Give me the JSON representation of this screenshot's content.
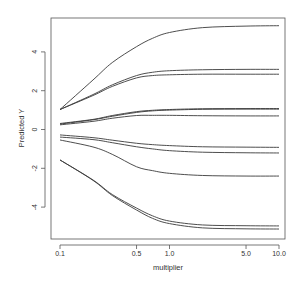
{
  "chart_data": {
    "type": "line",
    "title": "",
    "xlabel": "multiplier",
    "ylabel": "Predicted Y",
    "x_scale": "log",
    "xlim": [
      0.1,
      10.0
    ],
    "ylim": [
      -5.6,
      5.6
    ],
    "grid": false,
    "legend": null,
    "x_ticks": [
      {
        "value": 0.1,
        "label": "0.1"
      },
      {
        "value": 0.5,
        "label": "0.5"
      },
      {
        "value": 1.0,
        "label": "1.0"
      },
      {
        "value": 5.0,
        "label": "5.0"
      },
      {
        "value": 10.0,
        "label": "10.0"
      }
    ],
    "y_ticks": [
      {
        "value": 4,
        "label": "4"
      },
      {
        "value": 2,
        "label": "2"
      },
      {
        "value": 0,
        "label": "0"
      },
      {
        "value": -2,
        "label": "-2"
      },
      {
        "value": -4,
        "label": "-4"
      }
    ],
    "x": [
      0.1,
      0.2,
      0.3,
      0.5,
      0.7,
      1.0,
      2.0,
      5.0,
      10.0
    ],
    "series": [
      {
        "name": "line-1",
        "values": [
          1.03,
          2.55,
          3.45,
          4.27,
          4.7,
          5.0,
          5.25,
          5.33,
          5.35
        ]
      },
      {
        "name": "line-2",
        "values": [
          1.03,
          1.8,
          2.3,
          2.78,
          2.95,
          3.03,
          3.08,
          3.1,
          3.1
        ]
      },
      {
        "name": "line-3",
        "values": [
          1.03,
          1.75,
          2.22,
          2.66,
          2.78,
          2.82,
          2.85,
          2.85,
          2.85
        ]
      },
      {
        "name": "line-4",
        "values": [
          0.31,
          0.52,
          0.72,
          0.92,
          0.99,
          1.03,
          1.07,
          1.08,
          1.08
        ]
      },
      {
        "name": "line-5",
        "values": [
          0.28,
          0.5,
          0.68,
          0.88,
          0.96,
          1.0,
          1.04,
          1.05,
          1.05
        ]
      },
      {
        "name": "line-6",
        "values": [
          0.24,
          0.42,
          0.58,
          0.72,
          0.73,
          0.73,
          0.71,
          0.7,
          0.7
        ]
      },
      {
        "name": "line-7",
        "values": [
          -0.28,
          -0.42,
          -0.55,
          -0.71,
          -0.78,
          -0.83,
          -0.89,
          -0.91,
          -0.92
        ]
      },
      {
        "name": "line-8",
        "values": [
          -0.39,
          -0.52,
          -0.68,
          -0.89,
          -1.0,
          -1.09,
          -1.17,
          -1.2,
          -1.21
        ]
      },
      {
        "name": "line-9",
        "values": [
          -0.54,
          -0.9,
          -1.28,
          -1.92,
          -2.12,
          -2.26,
          -2.37,
          -2.4,
          -2.4
        ]
      },
      {
        "name": "line-10",
        "values": [
          -1.57,
          -2.6,
          -3.35,
          -4.05,
          -4.45,
          -4.72,
          -4.92,
          -4.96,
          -4.97
        ]
      },
      {
        "name": "line-11",
        "values": [
          -1.57,
          -2.62,
          -3.4,
          -4.15,
          -4.58,
          -4.85,
          -5.07,
          -5.12,
          -5.13
        ]
      }
    ]
  },
  "plot": {
    "line_color": "#3a3a3a",
    "axis_color": "#555555"
  }
}
